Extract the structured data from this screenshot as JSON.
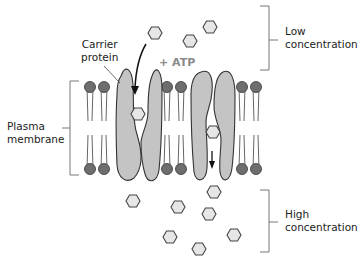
{
  "labels": {
    "carrier_protein": [
      "Carrier",
      "protein"
    ],
    "atp": "+ ATP",
    "plasma_membrane": [
      "Plasma",
      "membrane"
    ],
    "low_concentration": [
      "Low",
      "concentration"
    ],
    "high_concentration": [
      "High",
      "concentration"
    ]
  },
  "colors": {
    "protein_fill": "#c4c4c4",
    "protein_stroke": "#333333",
    "lipid_head": "#6e6e6e",
    "molecule_fill": "#e6e6e6",
    "molecule_stroke": "#444444",
    "bracket": "#777777",
    "atp_text": "#8a8a8a"
  }
}
